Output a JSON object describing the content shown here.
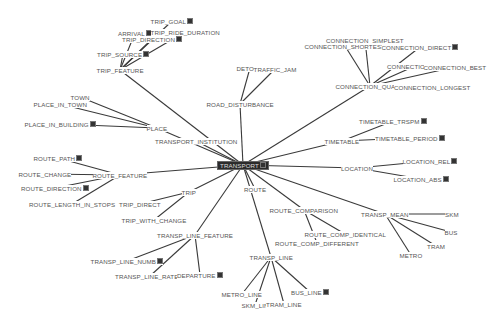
{
  "diagram": {
    "root": "TRANSPORT",
    "colors": {
      "background": "#ffffff",
      "edge": "#3a3a3a",
      "label": "#555555",
      "root_bg": "#2b2b2b",
      "root_text": "#dddddd"
    },
    "nodes": [
      {
        "id": "TRANSPORT",
        "label": "TRANSPORT",
        "x": 243,
        "y": 165,
        "root": true,
        "badge": true
      },
      {
        "id": "TRIP_FEATURE",
        "label": "TRIP_FEATURE",
        "x": 120,
        "y": 70
      },
      {
        "id": "TRIP_GOAL",
        "label": "TRIP_GOAL",
        "x": 172,
        "y": 21,
        "badge": true
      },
      {
        "id": "ARRIVAL",
        "label": "ARRIVAL",
        "x": 135,
        "y": 33,
        "badge": true
      },
      {
        "id": "TRIP_RIDE_DURATION",
        "label": "TRIP_RIDE_DURATION",
        "x": 185,
        "y": 32
      },
      {
        "id": "TRIP_DIRECTION",
        "label": "TRIP_DIRECTION",
        "x": 152,
        "y": 39,
        "badge": true
      },
      {
        "id": "TRIP_SOURCE",
        "label": "TRIP_SOURCE",
        "x": 123,
        "y": 54,
        "badge": true
      },
      {
        "id": "TRANSPORT_INSTITUTION",
        "label": "TRANSPORT_INSTITUTION",
        "x": 196,
        "y": 141
      },
      {
        "id": "PLACE",
        "label": "PLACE",
        "x": 157,
        "y": 128
      },
      {
        "id": "TOWN",
        "label": "TOWN",
        "x": 80,
        "y": 97
      },
      {
        "id": "PLACE_IN_TOWN",
        "label": "PLACE_IN_TOWN",
        "x": 60,
        "y": 104
      },
      {
        "id": "PLACE_IN_BUILDING",
        "label": "PLACE_IN_BUILDING",
        "x": 60,
        "y": 124,
        "badge": true
      },
      {
        "id": "ROAD_DISTURBANCE",
        "label": "ROAD_DISTURBANCE",
        "x": 240,
        "y": 104
      },
      {
        "id": "DETOUR",
        "label": "DETOUR",
        "x": 250,
        "y": 68
      },
      {
        "id": "TRAFFIC_JAM",
        "label": "TRAFFIC_JAM",
        "x": 275,
        "y": 69
      },
      {
        "id": "CONNECTION_QUALITY",
        "label": "CONNECTION_QUALIT",
        "x": 370,
        "y": 86
      },
      {
        "id": "CONNECTION_SIMPLEST",
        "label": "CONNECTION_SIMPLEST",
        "x": 365,
        "y": 40
      },
      {
        "id": "CONNECTION_SHORTEST",
        "label": "CONNECTION_SHORTEST",
        "x": 345,
        "y": 46
      },
      {
        "id": "CONNECTION_DIRECT",
        "label": "CONNECTION_DIRECT",
        "x": 420,
        "y": 47,
        "badge": true
      },
      {
        "id": "CONNECTION_NO",
        "label": "CONNECTION_NO",
        "x": 415,
        "y": 66
      },
      {
        "id": "CONNECTION_BEST",
        "label": "CONNECTION_BEST",
        "x": 455,
        "y": 67
      },
      {
        "id": "CONNECTION_LONGEST",
        "label": "CONNECTION_LONGEST",
        "x": 432,
        "y": 87
      },
      {
        "id": "TIMETABLE",
        "label": "TIMETABLE",
        "x": 342,
        "y": 141
      },
      {
        "id": "TIMETABLE_TRSPM",
        "label": "TIMETABLE_TRSPM",
        "x": 393,
        "y": 121,
        "badge": true
      },
      {
        "id": "TIMETABLE_PERIOD",
        "label": "TIMETABLE_PERIOD",
        "x": 410,
        "y": 138,
        "badge": true
      },
      {
        "id": "LOCATION",
        "label": "LOCATION",
        "x": 357,
        "y": 168
      },
      {
        "id": "LOCATION_REL",
        "label": "LOCATION_REL",
        "x": 430,
        "y": 161,
        "badge": true
      },
      {
        "id": "LOCATION_ABS",
        "label": "LOCATION_ABS",
        "x": 421,
        "y": 179,
        "badge": true
      },
      {
        "id": "ROUTE_FEATURE",
        "label": "ROUTE_FEATURE",
        "x": 120,
        "y": 175
      },
      {
        "id": "ROUTE_PATH",
        "label": "ROUTE_PATH",
        "x": 58,
        "y": 158,
        "badge": true
      },
      {
        "id": "ROUTE_CHANGE",
        "label": "ROUTE_CHANGE",
        "x": 45,
        "y": 174
      },
      {
        "id": "ROUTE_DIRECTION",
        "label": "ROUTE_DIRECTION",
        "x": 55,
        "y": 188,
        "badge": true
      },
      {
        "id": "ROUTE_LENGTH_IN_STOPS",
        "label": "ROUTE_LENGTH_IN_STOPS",
        "x": 72,
        "y": 204
      },
      {
        "id": "ROUTE",
        "label": "ROUTE",
        "x": 255,
        "y": 189
      },
      {
        "id": "TRIP",
        "label": "TRIP",
        "x": 189,
        "y": 192
      },
      {
        "id": "TRIP_DIRECT",
        "label": "TRIP_DIRECT",
        "x": 140,
        "y": 204
      },
      {
        "id": "TRIP_WITH_CHANGE",
        "label": "TRIP_WITH_CHANGE",
        "x": 154,
        "y": 220
      },
      {
        "id": "ROUTE_COMPARISON",
        "label": "ROUTE_COMPARISON",
        "x": 304,
        "y": 210
      },
      {
        "id": "ROUTE_COMP_IDENTICAL",
        "label": "ROUTE_COMP_IDENTICAL",
        "x": 345,
        "y": 234
      },
      {
        "id": "ROUTE_COMP_DIFFERENT",
        "label": "ROUTE_COMP_DIFFERENT",
        "x": 317,
        "y": 243
      },
      {
        "id": "TRANSP_MEAN",
        "label": "TRANSP_MEAN",
        "x": 385,
        "y": 214
      },
      {
        "id": "SKM",
        "label": "SKM",
        "x": 452,
        "y": 214
      },
      {
        "id": "BUS",
        "label": "BUS",
        "x": 451,
        "y": 232
      },
      {
        "id": "TRAM",
        "label": "TRAM",
        "x": 436,
        "y": 246
      },
      {
        "id": "METRO",
        "label": "METRO",
        "x": 411,
        "y": 255
      },
      {
        "id": "TRANSP_LINE_FEATURE",
        "label": "TRANSP_LINE_FEATURE",
        "x": 195,
        "y": 235
      },
      {
        "id": "TRANSP_LINE_NUMB",
        "label": "TRANSP_LINE_NUMB",
        "x": 127,
        "y": 261,
        "badge": true
      },
      {
        "id": "TRANSP_LINE_RATE",
        "label": "TRANSP_LINE_RATE",
        "x": 150,
        "y": 276,
        "badge": true
      },
      {
        "id": "DEPARTURE",
        "label": "DEPARTURE",
        "x": 200,
        "y": 275,
        "badge": true
      },
      {
        "id": "TRANSP_LINE",
        "label": "TRANSP_LINE",
        "x": 271,
        "y": 257
      },
      {
        "id": "METRO_LINE",
        "label": "METRO_LINE",
        "x": 242,
        "y": 294
      },
      {
        "id": "SKM_LINE",
        "label": "SKM_LIN",
        "x": 255,
        "y": 305
      },
      {
        "id": "TRAM_LINE",
        "label": "TRAM_LINE",
        "x": 284,
        "y": 304
      },
      {
        "id": "BUS_LINE",
        "label": "BUS_LINE",
        "x": 310,
        "y": 292,
        "badge": true
      }
    ],
    "edges": [
      [
        "TRANSPORT",
        "TRIP_FEATURE"
      ],
      [
        "TRIP_FEATURE",
        "TRIP_GOAL"
      ],
      [
        "TRIP_FEATURE",
        "ARRIVAL"
      ],
      [
        "TRIP_FEATURE",
        "TRIP_RIDE_DURATION"
      ],
      [
        "TRIP_FEATURE",
        "TRIP_DIRECTION"
      ],
      [
        "TRIP_FEATURE",
        "TRIP_SOURCE"
      ],
      [
        "TRANSPORT",
        "TRANSPORT_INSTITUTION"
      ],
      [
        "TRANSPORT",
        "PLACE"
      ],
      [
        "PLACE",
        "TOWN"
      ],
      [
        "PLACE",
        "PLACE_IN_TOWN"
      ],
      [
        "PLACE",
        "PLACE_IN_BUILDING"
      ],
      [
        "TRANSPORT",
        "ROAD_DISTURBANCE"
      ],
      [
        "ROAD_DISTURBANCE",
        "DETOUR"
      ],
      [
        "ROAD_DISTURBANCE",
        "TRAFFIC_JAM"
      ],
      [
        "TRANSPORT",
        "CONNECTION_QUALITY"
      ],
      [
        "CONNECTION_QUALITY",
        "CONNECTION_SIMPLEST"
      ],
      [
        "CONNECTION_QUALITY",
        "CONNECTION_SHORTEST"
      ],
      [
        "CONNECTION_QUALITY",
        "CONNECTION_DIRECT"
      ],
      [
        "CONNECTION_QUALITY",
        "CONNECTION_NO"
      ],
      [
        "CONNECTION_QUALITY",
        "CONNECTION_BEST"
      ],
      [
        "CONNECTION_QUALITY",
        "CONNECTION_LONGEST"
      ],
      [
        "TRANSPORT",
        "TIMETABLE"
      ],
      [
        "TIMETABLE",
        "TIMETABLE_TRSPM"
      ],
      [
        "TIMETABLE",
        "TIMETABLE_PERIOD"
      ],
      [
        "TRANSPORT",
        "LOCATION"
      ],
      [
        "LOCATION",
        "LOCATION_REL"
      ],
      [
        "LOCATION",
        "LOCATION_ABS"
      ],
      [
        "TRANSPORT",
        "ROUTE_FEATURE"
      ],
      [
        "ROUTE_FEATURE",
        "ROUTE_PATH"
      ],
      [
        "ROUTE_FEATURE",
        "ROUTE_CHANGE"
      ],
      [
        "ROUTE_FEATURE",
        "ROUTE_DIRECTION"
      ],
      [
        "ROUTE_FEATURE",
        "ROUTE_LENGTH_IN_STOPS"
      ],
      [
        "TRANSPORT",
        "ROUTE"
      ],
      [
        "TRANSPORT",
        "TRIP"
      ],
      [
        "TRIP",
        "TRIP_DIRECT"
      ],
      [
        "TRIP",
        "TRIP_WITH_CHANGE"
      ],
      [
        "TRANSPORT",
        "ROUTE_COMPARISON"
      ],
      [
        "ROUTE_COMPARISON",
        "ROUTE_COMP_IDENTICAL"
      ],
      [
        "ROUTE_COMPARISON",
        "ROUTE_COMP_DIFFERENT"
      ],
      [
        "TRANSPORT",
        "TRANSP_MEAN"
      ],
      [
        "TRANSP_MEAN",
        "SKM"
      ],
      [
        "TRANSP_MEAN",
        "BUS"
      ],
      [
        "TRANSP_MEAN",
        "TRAM"
      ],
      [
        "TRANSP_MEAN",
        "METRO"
      ],
      [
        "TRANSPORT",
        "TRANSP_LINE_FEATURE"
      ],
      [
        "TRANSP_LINE_FEATURE",
        "TRANSP_LINE_NUMB"
      ],
      [
        "TRANSP_LINE_FEATURE",
        "TRANSP_LINE_RATE"
      ],
      [
        "TRANSP_LINE_FEATURE",
        "DEPARTURE"
      ],
      [
        "TRANSPORT",
        "TRANSP_LINE"
      ],
      [
        "TRANSP_LINE",
        "METRO_LINE"
      ],
      [
        "TRANSP_LINE",
        "SKM_LINE"
      ],
      [
        "TRANSP_LINE",
        "TRAM_LINE"
      ],
      [
        "TRANSP_LINE",
        "BUS_LINE"
      ]
    ]
  }
}
